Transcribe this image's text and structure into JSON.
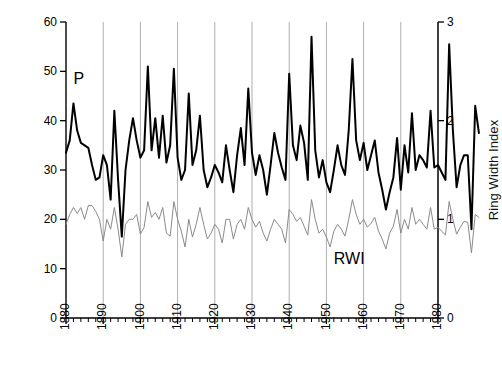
{
  "chart_data": {
    "type": "line",
    "title": "",
    "xlabel": "",
    "ylabel_left": "August–July Precipitation (cm)",
    "ylabel_right": "Ring Width Index",
    "xlim": [
      1880,
      1980
    ],
    "ylim_left": [
      0,
      60
    ],
    "ylim_right": [
      0,
      3
    ],
    "xticks": [
      1880,
      1890,
      1900,
      1910,
      1920,
      1930,
      1940,
      1950,
      1960,
      1970,
      1980
    ],
    "xtick_labels": [
      "1880",
      "1890",
      "1900",
      "1910",
      "1920",
      "1930",
      "1940",
      "1950",
      "1960",
      "1970",
      "1980"
    ],
    "xtick_minor_step": 2,
    "yticks_left": [
      0,
      10,
      20,
      30,
      40,
      50,
      60
    ],
    "ytick_labels_left": [
      "0",
      "10",
      "20",
      "30",
      "40",
      "50",
      "60"
    ],
    "yticks_right": [
      0,
      1,
      2,
      3
    ],
    "ytick_labels_right": [
      "0",
      "1",
      "2",
      "3"
    ],
    "grid": "vertical-decades",
    "grid_color": "#999999",
    "legend_position": "inline-annotations",
    "annotations": [
      {
        "text": "P",
        "x": 1882,
        "y_left": 48.5,
        "name": "precipitation-label"
      },
      {
        "text": "RWI",
        "x": 1952,
        "y_left": 12.0,
        "name": "rwi-label"
      }
    ],
    "series": [
      {
        "name": "P",
        "label": "August–July Precipitation (cm)",
        "axis": "left",
        "color": "#000000",
        "line_width": 2.0,
        "x_start": 1880,
        "values": [
          33.5,
          36.0,
          43.5,
          38.0,
          35.5,
          35.0,
          34.5,
          31.0,
          28.0,
          28.5,
          33.0,
          31.0,
          24.0,
          42.0,
          28.0,
          16.5,
          30.0,
          36.0,
          40.5,
          36.0,
          32.5,
          34.0,
          51.0,
          34.0,
          40.5,
          32.5,
          41.0,
          31.5,
          35.0,
          50.5,
          32.5,
          28.0,
          30.0,
          45.5,
          31.0,
          34.0,
          41.0,
          30.0,
          26.5,
          28.5,
          31.0,
          29.5,
          27.5,
          35.0,
          30.0,
          25.5,
          33.0,
          38.5,
          31.0,
          46.5,
          33.5,
          29.0,
          33.0,
          30.0,
          25.0,
          31.0,
          37.5,
          33.5,
          30.5,
          28.0,
          49.5,
          35.0,
          32.0,
          39.0,
          35.5,
          28.0,
          57.0,
          34.0,
          28.5,
          32.0,
          27.5,
          25.5,
          30.0,
          35.0,
          31.0,
          29.0,
          38.0,
          52.5,
          36.0,
          32.0,
          35.5,
          30.0,
          33.0,
          36.0,
          29.5,
          26.0,
          22.0,
          25.5,
          28.5,
          36.5,
          26.0,
          35.0,
          29.5,
          41.5,
          30.0,
          33.0,
          32.0,
          30.5,
          42.0,
          30.5,
          31.0,
          29.5,
          28.0,
          55.5,
          38.0,
          26.5,
          31.0,
          33.0,
          33.0,
          18.0,
          43.0,
          37.5
        ]
      },
      {
        "name": "RWI",
        "label": "Ring Width Index",
        "axis": "right",
        "color": "#8a8a8a",
        "line_width": 1.0,
        "x_start": 1880,
        "values": [
          0.95,
          1.05,
          1.12,
          1.06,
          1.12,
          1.0,
          1.14,
          1.14,
          1.08,
          1.0,
          0.78,
          1.0,
          0.9,
          1.12,
          0.9,
          0.62,
          0.95,
          1.0,
          1.0,
          1.05,
          0.85,
          0.92,
          1.18,
          1.02,
          1.07,
          1.0,
          1.12,
          0.86,
          0.83,
          1.18,
          1.0,
          0.88,
          0.72,
          1.0,
          0.82,
          0.95,
          1.12,
          0.95,
          0.8,
          0.86,
          0.95,
          0.9,
          0.76,
          1.0,
          1.0,
          0.8,
          0.95,
          1.0,
          0.9,
          1.12,
          1.0,
          0.92,
          0.98,
          0.86,
          0.78,
          0.9,
          1.0,
          0.95,
          0.9,
          0.76,
          1.1,
          1.05,
          0.98,
          1.02,
          0.93,
          0.84,
          1.2,
          1.0,
          0.86,
          0.9,
          0.82,
          0.72,
          0.88,
          0.95,
          0.9,
          0.83,
          1.0,
          1.2,
          1.05,
          0.95,
          1.0,
          0.92,
          0.96,
          1.02,
          0.88,
          0.8,
          0.7,
          0.86,
          0.93,
          1.1,
          0.86,
          1.0,
          0.9,
          1.12,
          0.95,
          1.0,
          0.95,
          0.9,
          1.12,
          0.9,
          0.92,
          0.88,
          0.84,
          1.18,
          1.0,
          0.85,
          0.92,
          0.98,
          0.97,
          0.66,
          1.05,
          1.02
        ]
      }
    ]
  }
}
